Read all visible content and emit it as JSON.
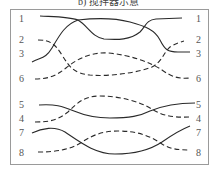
{
  "caption": "b) 搅拌器示意",
  "labels": {
    "left": [
      {
        "text": "1",
        "y": 14
      },
      {
        "text": "2",
        "y": 35
      },
      {
        "text": "3",
        "y": 49
      },
      {
        "text": "6",
        "y": 74
      },
      {
        "text": "5",
        "y": 100
      },
      {
        "text": "4",
        "y": 114
      },
      {
        "text": "7",
        "y": 128
      },
      {
        "text": "8",
        "y": 148
      }
    ],
    "right": [
      {
        "text": "1",
        "y": 14
      },
      {
        "text": "2",
        "y": 35
      },
      {
        "text": "3",
        "y": 49
      },
      {
        "text": "6",
        "y": 74
      },
      {
        "text": "5",
        "y": 100
      },
      {
        "text": "4",
        "y": 114
      },
      {
        "text": "7",
        "y": 128
      },
      {
        "text": "8",
        "y": 148
      }
    ]
  },
  "lines": [
    {
      "id": "1",
      "style": "solid",
      "d": "M40,16 C60,17 70,17 78,20 C88,26 92,37 104,39 C118,40 130,40 140,32 C146,26 146,20 156,19 L182,18"
    },
    {
      "id": "3",
      "style": "solid",
      "d": "M32,62 C42,57 46,58 52,48 C60,34 66,24 78,20 C95,18 115,18 130,22 C145,26 155,30 160,40 C165,50 168,52 178,52 L190,52"
    },
    {
      "id": "2",
      "style": "dashed",
      "d": "M38,40 C50,40 55,44 62,55 C70,68 74,73 90,75 C110,77 140,72 152,67 C162,62 164,52 170,47 C175,44 180,42 184,41"
    },
    {
      "id": "6",
      "style": "dashed",
      "d": "M35,79 C48,79 56,76 66,68 C78,58 92,52 108,53 C130,55 150,62 162,70 C172,77 178,79 190,78"
    },
    {
      "id": "5",
      "style": "solid",
      "d": "M39,105 C55,104 62,106 74,111 C86,116 96,118 110,118 C130,118 140,116 150,111 C162,106 175,103 195,103"
    },
    {
      "id": "4",
      "style": "dashed",
      "d": "M35,122 C50,122 58,120 68,112 C78,102 85,96 100,96 C120,96 140,102 150,108 C160,114 168,118 190,117"
    },
    {
      "id": "7",
      "style": "solid",
      "d": "M32,133 C42,128 55,126 65,132 C80,142 95,154 115,154 C135,154 150,150 162,142 C172,135 180,130 190,126"
    },
    {
      "id": "8",
      "style": "dashed",
      "d": "M38,152 C55,152 70,150 82,142 C94,134 105,131 118,131 C138,131 150,136 162,144 C170,149 178,150 190,150"
    }
  ],
  "colors": {
    "stroke": "#2a2a2a",
    "frame": "#9a9a9a",
    "label": "#555555"
  }
}
